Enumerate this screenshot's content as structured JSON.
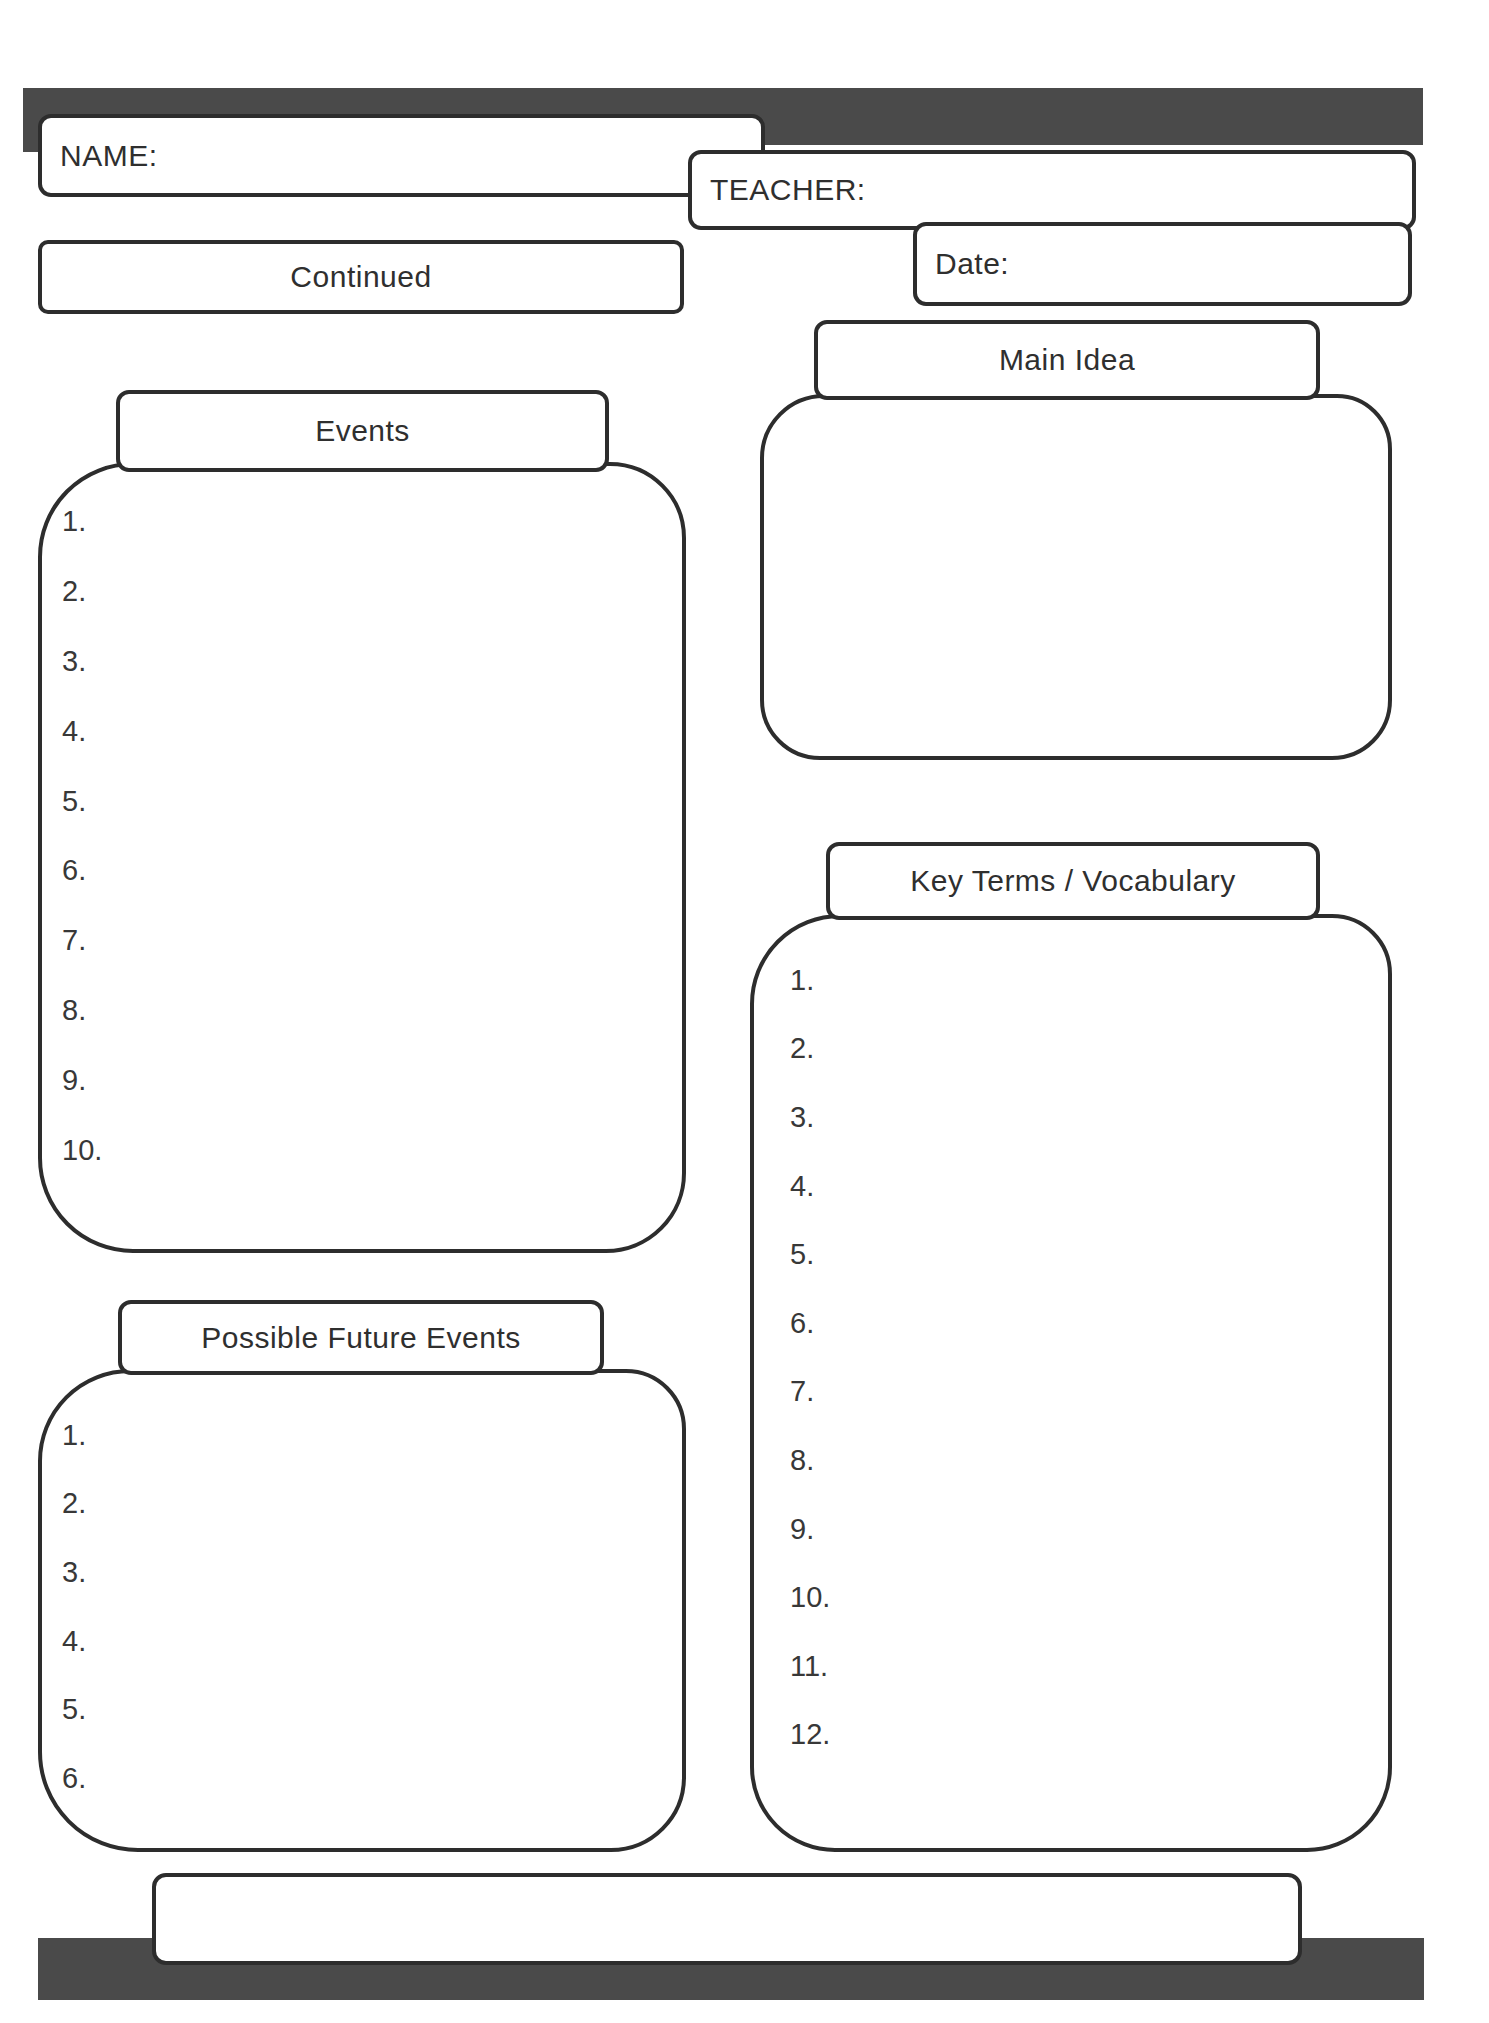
{
  "page": {
    "banner_color": "#4a4a4a",
    "line_color": "#2d2d2d",
    "background_color": "#ffffff"
  },
  "header": {
    "name_label": "NAME:",
    "teacher_label": "TEACHER:",
    "date_label": "Date:",
    "continued_label": "Continued"
  },
  "sections": {
    "events": {
      "title": "Events",
      "items": [
        "1.",
        "2.",
        "3.",
        "4.",
        "5.",
        "6.",
        "7.",
        "8.",
        "9.",
        "10."
      ]
    },
    "main_idea": {
      "title": "Main Idea"
    },
    "key_terms": {
      "title": "Key Terms / Vocabulary",
      "items": [
        "1.",
        "2.",
        "3.",
        "4.",
        "5.",
        "6.",
        "7.",
        "8.",
        "9.",
        "10.",
        "11.",
        "12."
      ]
    },
    "possible_future_events": {
      "title": "Possible Future Events",
      "items": [
        "1.",
        "2.",
        "3.",
        "4.",
        "5.",
        "6."
      ]
    }
  }
}
